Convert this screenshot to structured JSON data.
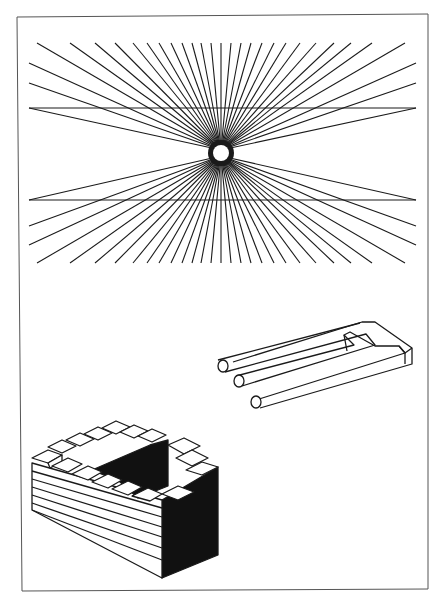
{
  "figure": {
    "background": "#ffffff",
    "ink": "#1a1a1a",
    "frame": {
      "x1": 17,
      "y1": 17,
      "x2": 428,
      "y2": 591,
      "color": "#555555"
    },
    "panels": [
      {
        "name": "hering-illusion",
        "description": "Two parallel horizontal lines over a radiating fan of lines with a white circle at the center"
      },
      {
        "name": "impossible-trident",
        "description": "Blivet / devil's tuning fork: three cylindrical prongs merging into two rectangular tines"
      },
      {
        "name": "penrose-stairs",
        "description": "Impossible staircase on a striped block with a black right face"
      }
    ],
    "hering": {
      "center": [
        221,
        153
      ],
      "circle_radius": 8,
      "upper_line_y": 108,
      "lower_line_y": 200,
      "line_x_start": 29,
      "line_x_end": 416,
      "top_y": 43,
      "bottom_y": 263,
      "ray_count_per_side": 26
    }
  }
}
